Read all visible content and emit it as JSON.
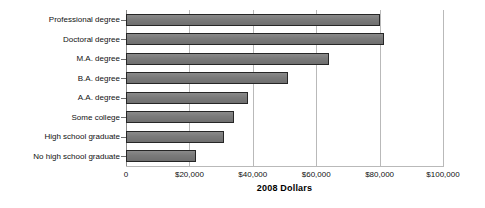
{
  "chart_data": {
    "type": "bar",
    "orientation": "horizontal",
    "title": "",
    "xlabel": "2008 Dollars",
    "ylabel": "",
    "categories": [
      "Professional degree",
      "Doctoral degree",
      "M.A. degree",
      "B.A. degree",
      "A.A. degree",
      "Some college",
      "High school graduate",
      "No high school graduate"
    ],
    "values": [
      80000,
      81500,
      64000,
      51000,
      38500,
      34000,
      31000,
      22000
    ],
    "xlim": [
      0,
      100000
    ],
    "xticks": [
      0,
      20000,
      40000,
      60000,
      80000,
      100000
    ],
    "xticklabels": [
      "0",
      "$20,000",
      "$40,000",
      "$60,000",
      "$80,000",
      "$100,000"
    ],
    "grid": "vertical",
    "legend": "none",
    "bar_color": "#7c7c7c",
    "bar_border_color": "#262626",
    "gridline_color": "#b9b9b9",
    "background_color": "#ffffff"
  },
  "axis": {
    "x_title": "2008 Dollars"
  }
}
